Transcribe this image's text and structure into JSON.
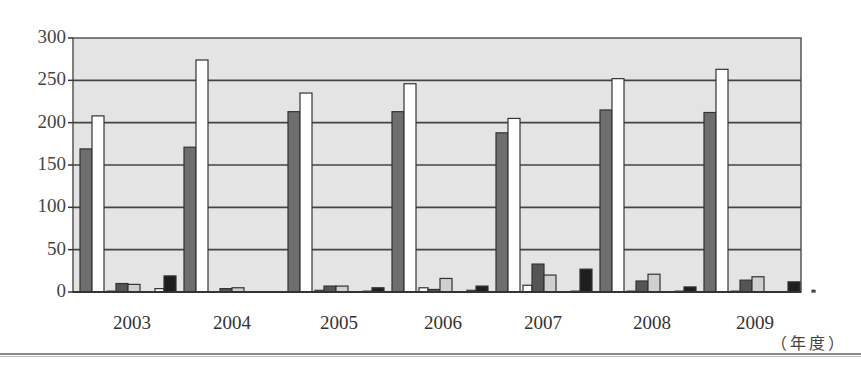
{
  "chart_data": {
    "type": "bar",
    "title": "",
    "xlabel": "（年度）",
    "ylabel": "",
    "ylim": [
      0,
      300
    ],
    "yticks": [
      0,
      50,
      100,
      150,
      200,
      250,
      300
    ],
    "grid": true,
    "legend": null,
    "categories": [
      "2003",
      "2004",
      "2005",
      "2006",
      "2007",
      "2008",
      "2009"
    ],
    "series": [
      {
        "name": "series-1",
        "color": "#6e6e6e",
        "values": [
          169,
          171,
          213,
          213,
          188,
          215,
          212
        ]
      },
      {
        "name": "series-2",
        "color": "#ffffff",
        "values": [
          208,
          274,
          235,
          246,
          205,
          252,
          263
        ]
      },
      {
        "name": "series-3",
        "color": "#ffffff",
        "values": [
          1,
          0,
          2,
          5,
          8,
          1,
          1
        ]
      },
      {
        "name": "series-4",
        "color": "#555555",
        "values": [
          10,
          4,
          7,
          3,
          33,
          13,
          14
        ]
      },
      {
        "name": "series-5",
        "color": "#cfcfcf",
        "values": [
          9,
          5,
          7,
          16,
          20,
          21,
          18
        ]
      },
      {
        "name": "series-6",
        "color": "#ffffff",
        "values": [
          4,
          0,
          1,
          2,
          1,
          1,
          0
        ]
      },
      {
        "name": "series-7",
        "color": "#1e1e1e",
        "values": [
          19,
          0,
          5,
          7,
          27,
          6,
          12
        ]
      },
      {
        "name": "series-8",
        "color": "#999999",
        "values": [
          2,
          1,
          2,
          2,
          2,
          2,
          2
        ]
      }
    ]
  },
  "axis": {
    "y_labels": [
      "300",
      "250",
      "200",
      "150",
      "100",
      "50",
      "0"
    ],
    "x_unit": "（年度）"
  },
  "style": {
    "plot_bg": "#e4e4e4",
    "grid_color": "#444444",
    "border_color": "#555555"
  }
}
